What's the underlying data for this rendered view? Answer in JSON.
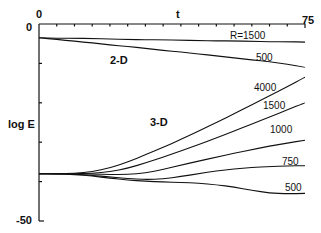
{
  "chart_data": {
    "type": "line",
    "title": "",
    "xlabel": "t",
    "ylabel": "log E",
    "xlim": [
      0,
      75
    ],
    "ylim": [
      -50,
      0
    ],
    "x_ticks": {
      "labels": [
        "0",
        "75"
      ],
      "minor_step": 5
    },
    "y_ticks": {
      "labels": [
        "0",
        "-50"
      ],
      "minor_step": 10
    },
    "grid": false,
    "legend": "inline labels",
    "groups": [
      {
        "label": "2-D",
        "series": [
          "2D R=1500",
          "2D R=500"
        ]
      },
      {
        "label": "3-D",
        "series": [
          "3D R=4000",
          "3D R=1500",
          "3D R=1000",
          "3D R=750",
          "3D R=500"
        ]
      }
    ],
    "x": [
      0,
      5,
      10,
      15,
      20,
      25,
      30,
      35,
      40,
      45,
      50,
      55,
      60,
      65,
      70,
      75
    ],
    "series": [
      {
        "name": "2D R=1500",
        "label": "R=1500",
        "values": [
          -3.5,
          -3.6,
          -3.6,
          -3.7,
          -3.8,
          -3.9,
          -4.0,
          -4.0,
          -4.1,
          -4.2,
          -4.3,
          -4.3,
          -4.4,
          -4.5,
          -4.5,
          -4.6
        ]
      },
      {
        "name": "2D R=500",
        "label": "500",
        "values": [
          -3.5,
          -3.9,
          -4.4,
          -4.8,
          -5.3,
          -5.7,
          -6.2,
          -6.7,
          -7.1,
          -7.6,
          -8.1,
          -8.6,
          -9.1,
          -9.6,
          -10.2,
          -11.0
        ]
      },
      {
        "name": "3D R=4000",
        "label": "4000",
        "values": [
          -38.0,
          -38.0,
          -37.9,
          -37.5,
          -36.5,
          -35.0,
          -33.2,
          -31.3,
          -29.3,
          -27.2,
          -25.0,
          -22.8,
          -20.5,
          -18.2,
          -15.9,
          -13.5
        ]
      },
      {
        "name": "3D R=1500",
        "label": "1500",
        "values": [
          -38.0,
          -38.0,
          -38.0,
          -37.9,
          -37.5,
          -36.6,
          -35.3,
          -33.8,
          -32.2,
          -30.6,
          -28.9,
          -27.2,
          -25.4,
          -23.6,
          -21.8,
          -20.0
        ]
      },
      {
        "name": "3D R=1000",
        "label": "1000",
        "values": [
          -38.0,
          -38.0,
          -38.0,
          -38.1,
          -38.2,
          -38.2,
          -37.8,
          -36.9,
          -35.8,
          -34.8,
          -33.8,
          -32.8,
          -31.9,
          -31.0,
          -30.2,
          -29.5
        ]
      },
      {
        "name": "3D R=750",
        "label": "750",
        "values": [
          -38.0,
          -38.0,
          -38.1,
          -38.4,
          -38.8,
          -39.2,
          -39.5,
          -39.3,
          -38.7,
          -38.0,
          -37.3,
          -36.8,
          -36.4,
          -36.2,
          -36.0,
          -36.0
        ]
      },
      {
        "name": "3D R=500",
        "label": "500",
        "values": [
          -38.0,
          -38.0,
          -38.2,
          -38.6,
          -39.1,
          -39.6,
          -39.9,
          -40.1,
          -40.2,
          -40.4,
          -40.8,
          -41.4,
          -42.2,
          -42.9,
          -43.1,
          -43.0
        ]
      }
    ],
    "annotations": [
      {
        "text": "2-D",
        "x": 25,
        "y": -9
      },
      {
        "text": "3-D",
        "x": 25,
        "y": -26
      },
      {
        "text": "R=1500",
        "x": 62,
        "y": -3
      },
      {
        "text": "500",
        "x": 67,
        "y": -8.5
      },
      {
        "text": "4000",
        "x": 65,
        "y": -11.5
      },
      {
        "text": "1500",
        "x": 68,
        "y": -18
      },
      {
        "text": "1000",
        "x": 68,
        "y": -26.5
      },
      {
        "text": "750",
        "x": 70,
        "y": -33.5
      },
      {
        "text": "500",
        "x": 70,
        "y": -40.5
      }
    ]
  },
  "labels": {
    "x_axis_title": "t",
    "y_axis_title": "log E",
    "x_min_label": "0",
    "x_max_label": "75",
    "y_max_label": "0",
    "y_min_label": "-50",
    "group_2d": "2-D",
    "group_3d": "3-D",
    "r1500_2d": "R=1500",
    "r500_2d": "500",
    "r4000": "4000",
    "r1500_3d": "1500",
    "r1000": "1000",
    "r750": "750",
    "r500_3d": "500"
  }
}
